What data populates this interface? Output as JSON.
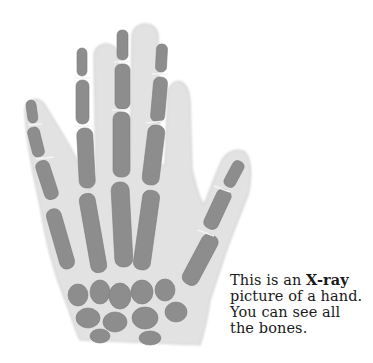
{
  "figure": {
    "icon": "hand-xray-icon",
    "colors": {
      "flesh": "#e3e3e3",
      "flesh_edge": "#d2d2d2",
      "bone": "#8f8f8f",
      "bone_dark": "#777777",
      "joint_gap": "#f2f2f2",
      "background": "#ffffff"
    }
  },
  "caption": {
    "line1_prefix": "This is an ",
    "line1_bold": "X-ray",
    "line2": "picture of a hand.",
    "line3": "You can see all",
    "line4": "the bones.",
    "text_color": "#1a1a1a"
  }
}
